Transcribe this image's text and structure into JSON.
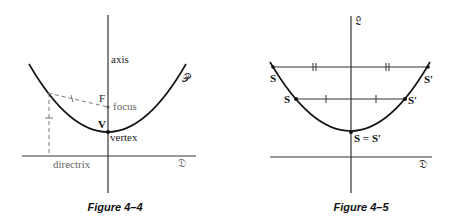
{
  "figures": [
    {
      "caption": "Figure 4–4",
      "labels": {
        "axis": "axis",
        "parabola": "𝒫",
        "focus_letter": "F",
        "focus": "focus",
        "vertex_letter": "V",
        "vertex": "vertex",
        "directrix": "directrix",
        "directrix_line": "𝔇"
      }
    },
    {
      "caption": "Figure 4–5",
      "labels": {
        "axis_line": "𝔏",
        "top_left": "S",
        "top_right": "S′",
        "mid_left": "S",
        "mid_right": "S′",
        "vertex": "S = S′",
        "directrix_line": "𝔇"
      }
    }
  ]
}
